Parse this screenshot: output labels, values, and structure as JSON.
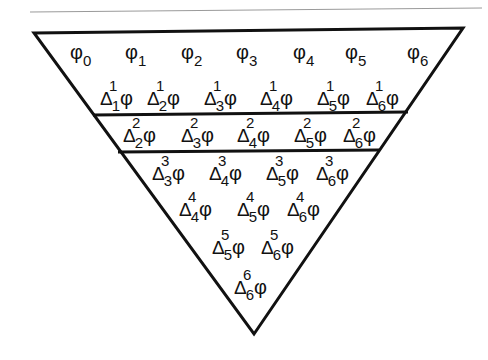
{
  "diagram": {
    "symbol": "φ",
    "delta": "Δ",
    "row0": [
      {
        "sym": "φ",
        "sub": "0",
        "x": 70,
        "y": 42
      },
      {
        "sym": "φ",
        "sub": "1",
        "x": 125,
        "y": 42
      },
      {
        "sym": "φ",
        "sub": "2",
        "x": 181,
        "y": 42
      },
      {
        "sym": "φ",
        "sub": "3",
        "x": 236,
        "y": 42
      },
      {
        "sym": "φ",
        "sub": "4",
        "x": 293,
        "y": 42
      },
      {
        "sym": "φ",
        "sub": "5",
        "x": 345,
        "y": 42
      },
      {
        "sym": "φ",
        "sub": "6",
        "x": 407,
        "y": 42
      }
    ],
    "rows": [
      {
        "order": "1",
        "items": [
          {
            "sub": "1",
            "x": 100,
            "y": 88
          },
          {
            "sub": "2",
            "x": 147,
            "y": 88
          },
          {
            "sub": "3",
            "x": 204,
            "y": 88
          },
          {
            "sub": "4",
            "x": 260,
            "y": 88
          },
          {
            "sub": "5",
            "x": 317,
            "y": 88
          },
          {
            "sub": "6",
            "x": 366,
            "y": 88
          }
        ]
      },
      {
        "order": "2",
        "items": [
          {
            "sub": "2",
            "x": 123,
            "y": 125
          },
          {
            "sub": "3",
            "x": 181,
            "y": 125
          },
          {
            "sub": "4",
            "x": 237,
            "y": 125
          },
          {
            "sub": "5",
            "x": 294,
            "y": 125
          },
          {
            "sub": "6",
            "x": 343,
            "y": 125
          }
        ]
      },
      {
        "order": "3",
        "items": [
          {
            "sub": "3",
            "x": 152,
            "y": 163
          },
          {
            "sub": "4",
            "x": 209,
            "y": 163
          },
          {
            "sub": "5",
            "x": 266,
            "y": 163
          },
          {
            "sub": "6",
            "x": 316,
            "y": 163
          }
        ]
      },
      {
        "order": "4",
        "items": [
          {
            "sub": "4",
            "x": 179,
            "y": 199
          },
          {
            "sub": "5",
            "x": 237,
            "y": 199
          },
          {
            "sub": "6",
            "x": 287,
            "y": 199
          }
        ]
      },
      {
        "order": "5",
        "items": [
          {
            "sub": "5",
            "x": 212,
            "y": 237
          },
          {
            "sub": "6",
            "x": 261,
            "y": 237
          }
        ]
      },
      {
        "order": "6",
        "items": [
          {
            "sub": "6",
            "x": 234,
            "y": 277
          }
        ]
      }
    ],
    "colors": {
      "line": "#111111",
      "rule": "#9a9a9a",
      "background": "#ffffff"
    }
  }
}
